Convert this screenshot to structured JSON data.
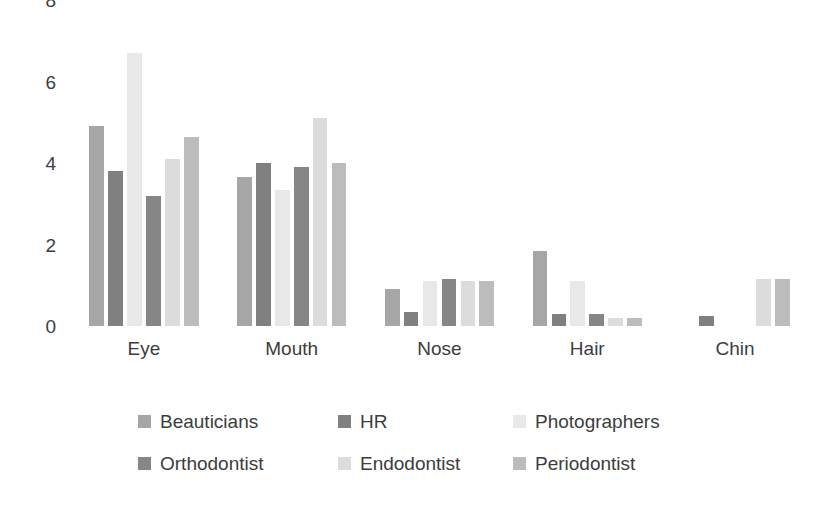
{
  "chart_data": {
    "type": "bar",
    "title": "",
    "subtitle": "",
    "xlabel": "",
    "ylabel": "",
    "categories": [
      "Eye",
      "Mouth",
      "Nose",
      "Hair",
      "Chin"
    ],
    "ylim": [
      0,
      8
    ],
    "yticks": [
      0,
      2,
      4,
      6,
      8
    ],
    "ytick_labels": [
      "0",
      "2",
      "4",
      "6",
      "8"
    ],
    "grid": false,
    "legend_position": "bottom",
    "series": [
      {
        "name": "Beauticians",
        "color": "#a6a6a6",
        "values": [
          4.9,
          3.65,
          0.9,
          1.85,
          0
        ]
      },
      {
        "name": "HR",
        "color": "#808080",
        "values": [
          3.8,
          4.0,
          0.35,
          0.3,
          0.25
        ]
      },
      {
        "name": "Photographers",
        "color": "#e8e8e8",
        "values": [
          6.7,
          3.35,
          1.1,
          1.1,
          0
        ]
      },
      {
        "name": "Orthodontist",
        "color": "#868686",
        "values": [
          3.2,
          3.9,
          1.15,
          0.3,
          0
        ]
      },
      {
        "name": "Endodontist",
        "color": "#dcdcdc",
        "values": [
          4.1,
          5.1,
          1.1,
          0.2,
          1.15
        ]
      },
      {
        "name": "Periodontist",
        "color": "#bcbcbc",
        "values": [
          4.65,
          4.0,
          1.1,
          0.2,
          1.15
        ]
      }
    ]
  }
}
